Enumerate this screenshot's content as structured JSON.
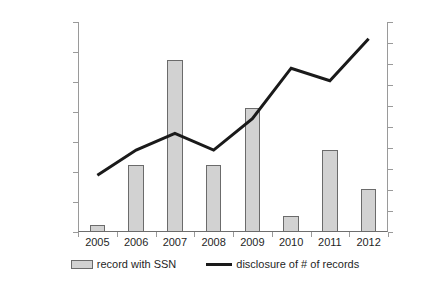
{
  "chart_data": {
    "type": "bar",
    "title": "",
    "xlabel": "",
    "ylabel": "",
    "grid": false,
    "legend_position": "bottom",
    "categories": [
      "2005",
      "2006",
      "2007",
      "2008",
      "2009",
      "2010",
      "2011",
      "2012"
    ],
    "axes": {
      "left": {
        "label": "",
        "min": 0,
        "max": 140000000,
        "step": 20000000,
        "ticks": [
          "0",
          "20,000,000",
          "40,000,000",
          "60,000,000",
          "80,000,000",
          "100,000,000",
          "120,000,000",
          "140,000,000"
        ],
        "tick_values": [
          0,
          20000000,
          40000000,
          60000000,
          80000000,
          100000000,
          120000000,
          140000000
        ]
      },
      "right": {
        "label": "",
        "min": 0,
        "max": 50,
        "step": 5,
        "ticks": [
          "0",
          "5",
          "10",
          "15",
          "20",
          "25",
          "30",
          "35",
          "40",
          "45",
          "50"
        ],
        "tick_values": [
          0,
          5,
          10,
          15,
          20,
          25,
          30,
          35,
          40,
          45,
          50
        ]
      }
    },
    "series": [
      {
        "name": "record with SSN",
        "type": "bar",
        "axis": "left",
        "color": "#d2d2d2",
        "border_color": "#6b6b6b",
        "values": [
          5000000,
          45000000,
          115000000,
          44500000,
          83000000,
          11000000,
          55000000,
          28500000
        ]
      },
      {
        "name": "disclosure of # of records",
        "type": "line",
        "axis": "right",
        "color": "#1a1a1a",
        "values": [
          13.5,
          19.5,
          23.5,
          19.5,
          27,
          39,
          36,
          46
        ]
      }
    ]
  },
  "legend": {
    "items": [
      {
        "label": "record with SSN",
        "marker": "bar-swatch-icon"
      },
      {
        "label": "disclosure of # of records",
        "marker": "line-swatch-icon"
      }
    ]
  }
}
